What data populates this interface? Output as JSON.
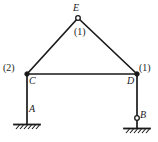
{
  "figure": {
    "type": "structural-frame-diagram",
    "stroke_color": "#1a1a1a",
    "background_color": "#ffffff",
    "line_width": 1.6
  },
  "joints": [
    {
      "id": "E",
      "label": "E",
      "x": 78,
      "y": 18,
      "marker": "open-circle",
      "label_position": "above"
    },
    {
      "id": "C",
      "label": "C",
      "x": 27,
      "y": 74,
      "marker": "filled-circle",
      "label_position": "below-right"
    },
    {
      "id": "D",
      "label": "D",
      "x": 137,
      "y": 74,
      "marker": "filled-circle",
      "label_position": "below-left"
    },
    {
      "id": "A",
      "label": "A",
      "x": 27,
      "y": 124,
      "marker": "none",
      "label_position": "above-right"
    },
    {
      "id": "B",
      "label": "B",
      "x": 137,
      "y": 118,
      "marker": "open-circle",
      "label_position": "right"
    }
  ],
  "members": [
    {
      "id": "CE",
      "from": "C",
      "to": "E",
      "stiffness_label": "(1)"
    },
    {
      "id": "ED",
      "from": "E",
      "to": "D",
      "stiffness_label": "(1)"
    },
    {
      "id": "CD",
      "from": "C",
      "to": "D",
      "stiffness_label": ""
    },
    {
      "id": "CA",
      "from": "C",
      "to": "A",
      "stiffness_label": "(2)"
    },
    {
      "id": "DB",
      "from": "D",
      "to": "B",
      "stiffness_label": "(1)"
    }
  ],
  "stiffness_labels": [
    {
      "id": "stiffness-apex",
      "text": "(1)",
      "x": 81,
      "y": 32,
      "applies_to": "roof members CE and ED"
    },
    {
      "id": "stiffness-left-column",
      "text": "(2)",
      "x": 10,
      "y": 68,
      "applies_to": "left column CA"
    },
    {
      "id": "stiffness-right-column",
      "text": "(1)",
      "x": 146,
      "y": 68,
      "applies_to": "right column DB"
    }
  ],
  "supports": [
    {
      "id": "support-A",
      "label": "A",
      "type": "fixed-hatched-base",
      "x": 27,
      "y": 124,
      "base_half_width": 13,
      "hatch_count": 6,
      "has_pin_circle": false
    },
    {
      "id": "support-B",
      "label": "B",
      "type": "pinned-hatched-base",
      "x": 137,
      "y": 128,
      "base_half_width": 13,
      "hatch_count": 6,
      "has_pin_circle": true,
      "pin_circle_y": 118
    }
  ],
  "geometry": {
    "apex": {
      "x": 78,
      "y": 18
    },
    "beam_left": {
      "x": 27,
      "y": 74
    },
    "beam_right": {
      "x": 137,
      "y": 74
    },
    "column_left_base": {
      "x": 27,
      "y": 124
    },
    "column_right_base": {
      "x": 137,
      "y": 128
    }
  }
}
